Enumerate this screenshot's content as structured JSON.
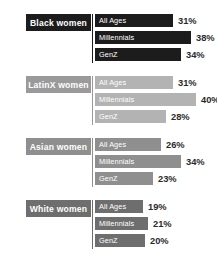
{
  "chart_data": {
    "type": "bar",
    "title": "",
    "xlabel": "",
    "ylabel": "",
    "orientation": "horizontal",
    "grid": false,
    "legend": "none",
    "xlim": [
      0,
      40
    ],
    "categories": [
      "All Ages",
      "Millennials",
      "GenZ"
    ],
    "series": [
      {
        "name": "Black women",
        "color": "#1c1c1c",
        "label_color": "#1c1c1c",
        "values": [
          31,
          38,
          34
        ],
        "value_labels": [
          "31%",
          "38%",
          "34%"
        ]
      },
      {
        "name": "LatinX women",
        "color": "#b3b3b3",
        "label_color": "#9a9a9a",
        "values": [
          31,
          40,
          28
        ],
        "value_labels": [
          "31%",
          "40%",
          "28%"
        ]
      },
      {
        "name": "Asian women",
        "color": "#8f8f8f",
        "label_color": "#8f8f8f",
        "values": [
          26,
          34,
          23
        ],
        "value_labels": [
          "26%",
          "34%",
          "23%"
        ]
      },
      {
        "name": "White women",
        "color": "#6e6e6e",
        "label_color": "#6e6e6e",
        "values": [
          19,
          21,
          20
        ],
        "value_labels": [
          "19%",
          "21%",
          "20%"
        ]
      }
    ]
  },
  "groups": [
    {
      "label": "Black women",
      "rows": [
        {
          "label": "All Ages",
          "value": "31%",
          "width": 31
        },
        {
          "label": "Millennials",
          "value": "38%",
          "width": 38
        },
        {
          "label": "GenZ",
          "value": "34%",
          "width": 34
        }
      ]
    },
    {
      "label": "LatinX women",
      "rows": [
        {
          "label": "All Ages",
          "value": "31%",
          "width": 31
        },
        {
          "label": "Millennials",
          "value": "40%",
          "width": 40
        },
        {
          "label": "GenZ",
          "value": "28%",
          "width": 28
        }
      ]
    },
    {
      "label": "Asian women",
      "rows": [
        {
          "label": "All Ages",
          "value": "26%",
          "width": 26
        },
        {
          "label": "Millennials",
          "value": "34%",
          "width": 34
        },
        {
          "label": "GenZ",
          "value": "23%",
          "width": 23
        }
      ]
    },
    {
      "label": "White women",
      "rows": [
        {
          "label": "All Ages",
          "value": "19%",
          "width": 19
        },
        {
          "label": "Millennials",
          "value": "21%",
          "width": 21
        },
        {
          "label": "GenZ",
          "value": "20%",
          "width": 20
        }
      ]
    }
  ]
}
